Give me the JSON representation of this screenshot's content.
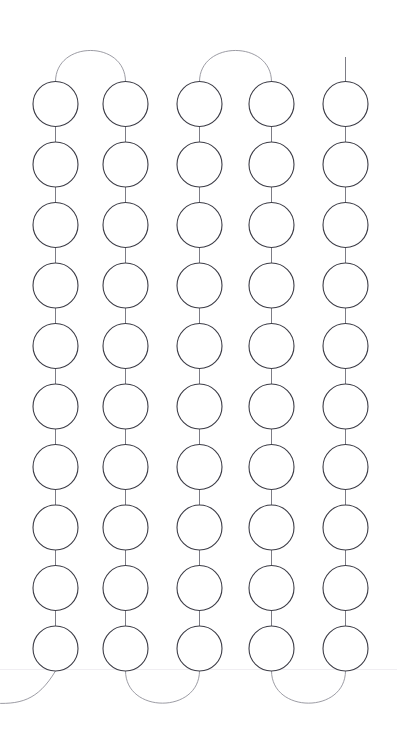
{
  "canvas": {
    "width": 397,
    "height": 743,
    "background_color": "#ffffff",
    "title": "Serpentine circle chain"
  },
  "style": {
    "node_stroke_color": "#3c3c46",
    "node_stroke_width": 1.1,
    "node_fill_color": "#ffffff",
    "node_radius": 22.5,
    "link_stroke_color": "#6e6e78",
    "link_stroke_width": 0.9,
    "arc_stroke_color": "#8a8a93",
    "arc_stroke_width": 0.85,
    "baseline_color": "#f0eef2",
    "baseline_width": 1
  },
  "layout": {
    "columns": 5,
    "rows": 10,
    "column_centers_x": [
      55.5,
      125.5,
      199.5,
      271.5,
      345.5
    ],
    "first_row_center_y": 104,
    "row_spacing_y": 60.5,
    "baseline_y": 669
  },
  "chart_data": {
    "type": "scatter",
    "xlabel": "",
    "ylabel": "",
    "grid": false,
    "legend": "none",
    "xlim": [
      0,
      397
    ],
    "ylim": [
      0,
      743
    ],
    "node_count": 50,
    "columns": 5,
    "rows": 10,
    "x": [
      55.5,
      125.5,
      199.5,
      271.5,
      345.5
    ],
    "y": [
      104,
      164.5,
      225,
      285.5,
      346,
      406.5,
      467,
      527.5,
      588,
      648.5
    ],
    "nodes": [
      {
        "col": 0,
        "cx": 55.5,
        "cy": 104,
        "r": 22.5
      },
      {
        "col": 0,
        "cx": 55.5,
        "cy": 164.5,
        "r": 22.5
      },
      {
        "col": 0,
        "cx": 55.5,
        "cy": 225,
        "r": 22.5
      },
      {
        "col": 0,
        "cx": 55.5,
        "cy": 285.5,
        "r": 22.5
      },
      {
        "col": 0,
        "cx": 55.5,
        "cy": 346,
        "r": 22.5
      },
      {
        "col": 0,
        "cx": 55.5,
        "cy": 406.5,
        "r": 22.5
      },
      {
        "col": 0,
        "cx": 55.5,
        "cy": 467,
        "r": 22.5
      },
      {
        "col": 0,
        "cx": 55.5,
        "cy": 527.5,
        "r": 22.5
      },
      {
        "col": 0,
        "cx": 55.5,
        "cy": 588,
        "r": 22.5
      },
      {
        "col": 0,
        "cx": 55.5,
        "cy": 648.5,
        "r": 22.5
      },
      {
        "col": 1,
        "cx": 125.5,
        "cy": 104,
        "r": 22.5
      },
      {
        "col": 1,
        "cx": 125.5,
        "cy": 164.5,
        "r": 22.5
      },
      {
        "col": 1,
        "cx": 125.5,
        "cy": 225,
        "r": 22.5
      },
      {
        "col": 1,
        "cx": 125.5,
        "cy": 285.5,
        "r": 22.5
      },
      {
        "col": 1,
        "cx": 125.5,
        "cy": 346,
        "r": 22.5
      },
      {
        "col": 1,
        "cx": 125.5,
        "cy": 406.5,
        "r": 22.5
      },
      {
        "col": 1,
        "cx": 125.5,
        "cy": 467,
        "r": 22.5
      },
      {
        "col": 1,
        "cx": 125.5,
        "cy": 527.5,
        "r": 22.5
      },
      {
        "col": 1,
        "cx": 125.5,
        "cy": 588,
        "r": 22.5
      },
      {
        "col": 1,
        "cx": 125.5,
        "cy": 648.5,
        "r": 22.5
      },
      {
        "col": 2,
        "cx": 199.5,
        "cy": 104,
        "r": 22.5
      },
      {
        "col": 2,
        "cx": 199.5,
        "cy": 164.5,
        "r": 22.5
      },
      {
        "col": 2,
        "cx": 199.5,
        "cy": 225,
        "r": 22.5
      },
      {
        "col": 2,
        "cx": 199.5,
        "cy": 285.5,
        "r": 22.5
      },
      {
        "col": 2,
        "cx": 199.5,
        "cy": 346,
        "r": 22.5
      },
      {
        "col": 2,
        "cx": 199.5,
        "cy": 406.5,
        "r": 22.5
      },
      {
        "col": 2,
        "cx": 199.5,
        "cy": 467,
        "r": 22.5
      },
      {
        "col": 2,
        "cx": 199.5,
        "cy": 527.5,
        "r": 22.5
      },
      {
        "col": 2,
        "cx": 199.5,
        "cy": 588,
        "r": 22.5
      },
      {
        "col": 2,
        "cx": 199.5,
        "cy": 648.5,
        "r": 22.5
      },
      {
        "col": 3,
        "cx": 271.5,
        "cy": 104,
        "r": 22.5
      },
      {
        "col": 3,
        "cx": 271.5,
        "cy": 164.5,
        "r": 22.5
      },
      {
        "col": 3,
        "cx": 271.5,
        "cy": 225,
        "r": 22.5
      },
      {
        "col": 3,
        "cx": 271.5,
        "cy": 285.5,
        "r": 22.5
      },
      {
        "col": 3,
        "cx": 271.5,
        "cy": 346,
        "r": 22.5
      },
      {
        "col": 3,
        "cx": 271.5,
        "cy": 406.5,
        "r": 22.5
      },
      {
        "col": 3,
        "cx": 271.5,
        "cy": 467,
        "r": 22.5
      },
      {
        "col": 3,
        "cx": 271.5,
        "cy": 527.5,
        "r": 22.5
      },
      {
        "col": 3,
        "cx": 271.5,
        "cy": 588,
        "r": 22.5
      },
      {
        "col": 3,
        "cx": 271.5,
        "cy": 648.5,
        "r": 22.5
      },
      {
        "col": 4,
        "cx": 345.5,
        "cy": 104,
        "r": 22.5
      },
      {
        "col": 4,
        "cx": 345.5,
        "cy": 164.5,
        "r": 22.5
      },
      {
        "col": 4,
        "cx": 345.5,
        "cy": 225,
        "r": 22.5
      },
      {
        "col": 4,
        "cx": 345.5,
        "cy": 285.5,
        "r": 22.5
      },
      {
        "col": 4,
        "cx": 345.5,
        "cy": 346,
        "r": 22.5
      },
      {
        "col": 4,
        "cx": 345.5,
        "cy": 406.5,
        "r": 22.5
      },
      {
        "col": 4,
        "cx": 345.5,
        "cy": 467,
        "r": 22.5
      },
      {
        "col": 4,
        "cx": 345.5,
        "cy": 527.5,
        "r": 22.5
      },
      {
        "col": 4,
        "cx": 345.5,
        "cy": 588,
        "r": 22.5
      },
      {
        "col": 4,
        "cx": 345.5,
        "cy": 648.5,
        "r": 22.5
      }
    ],
    "top_arcs": [
      {
        "name": "arc-col1-col2",
        "from_x": 55.5,
        "to_x": 125.5,
        "y": 81.5,
        "peak_y": 46
      },
      {
        "name": "arc-col3-col4",
        "from_x": 199.5,
        "to_x": 271.5,
        "y": 81.5,
        "peak_y": 46
      }
    ],
    "bottom_arcs": [
      {
        "name": "arc-col2-col3",
        "from_x": 125.5,
        "to_x": 199.5,
        "y": 671,
        "dip_y": 708
      },
      {
        "name": "arc-col4-col5",
        "from_x": 271.5,
        "to_x": 345.5,
        "y": 671,
        "dip_y": 708
      }
    ],
    "top_stub": {
      "name": "stub-col5-top",
      "x": 345.5,
      "from_y": 57,
      "to_y": 81.5
    },
    "bottom_exit": {
      "name": "exit-col1-bottom",
      "from_x": 55.5,
      "from_y": 671,
      "to_x": -10,
      "to_y": 703
    },
    "baseline": {
      "y": 669,
      "x_from": 0,
      "x_to": 397
    }
  },
  "accessibility": {
    "description": "A boustrophedon chain of fifty outlined circles arranged in five vertical columns of ten, linked by short vertical segments and connected at alternating tops and bottoms by semicircular arcs."
  }
}
